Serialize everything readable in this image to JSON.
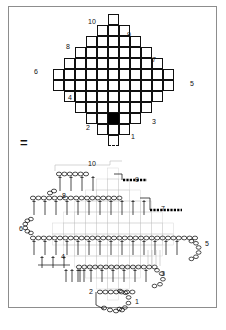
{
  "figure": {
    "type": "crochet-stitch-diagram",
    "equals_symbol": "=",
    "top_chart": {
      "name": "diamond-grid-chart",
      "description": "Diamond shaped square grid chart",
      "rows": [
        1,
        3,
        5,
        7,
        9,
        11,
        11,
        9,
        7,
        5,
        3,
        1
      ],
      "filled_cells": [
        {
          "row": 8,
          "col": 7,
          "label": "3"
        },
        {
          "row": 9,
          "col": 2,
          "label": "2"
        }
      ],
      "dashed_cells": [
        {
          "row": 11,
          "col": 0,
          "edge": "bottom"
        }
      ],
      "labels": [
        {
          "id": "10",
          "text": "10",
          "x": 88,
          "y": 18
        },
        {
          "id": "9",
          "text": "9",
          "x": 127,
          "y": 31
        },
        {
          "id": "8",
          "text": "8",
          "x": 66,
          "y": 43
        },
        {
          "id": "7",
          "text": "7",
          "x": 152,
          "y": 56
        },
        {
          "id": "6",
          "text": "6",
          "x": 34,
          "y": 68
        },
        {
          "id": "5",
          "text": "5",
          "x": 190,
          "y": 80
        },
        {
          "id": "4",
          "text": "4",
          "x": 68,
          "y": 94
        },
        {
          "id": "3",
          "text": "3",
          "x": 152,
          "y": 118
        },
        {
          "id": "2",
          "text": "2",
          "x": 86,
          "y": 124
        },
        {
          "id": "1",
          "text": "1",
          "x": 131,
          "y": 133
        }
      ]
    },
    "bottom_chart": {
      "name": "stitch-symbol-diagram",
      "description": "Unfolded crochet stitch diagram with chain loops and posts",
      "labels": [
        {
          "id": "10",
          "text": "10",
          "x": 88,
          "y": 160
        },
        {
          "id": "9",
          "text": "9",
          "x": 135,
          "y": 176
        },
        {
          "id": "8",
          "text": "8",
          "x": 62,
          "y": 192
        },
        {
          "id": "7",
          "text": "7",
          "x": 161,
          "y": 205
        },
        {
          "id": "6",
          "text": "6",
          "x": 19,
          "y": 225
        },
        {
          "id": "5",
          "text": "5",
          "x": 205,
          "y": 240
        },
        {
          "id": "4",
          "text": "4",
          "x": 61,
          "y": 253
        },
        {
          "id": "3",
          "text": "3",
          "x": 161,
          "y": 270
        },
        {
          "id": "2",
          "text": "2",
          "x": 89,
          "y": 288
        },
        {
          "id": "1",
          "text": "1",
          "x": 135,
          "y": 298
        }
      ],
      "stitch_symbols": {
        "chain": "oval-chain-loop",
        "post": "vertical-post-line",
        "slip": "dark-dashed-bar"
      }
    }
  },
  "colors": {
    "ink": "#111111",
    "frame": "#8d8d8d",
    "fill": "#000000",
    "paper": "#ffffff",
    "faint": "#b8b8b8"
  }
}
